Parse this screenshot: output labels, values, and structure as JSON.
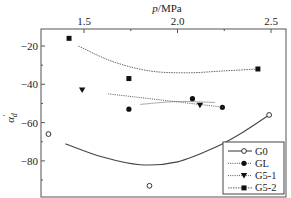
{
  "chart_data": {
    "type": "scatter",
    "title": "",
    "xlabel": "p/MPa",
    "xlabel_position": "top",
    "ylabel": "α'd",
    "xlim": [
      1.27,
      2.58
    ],
    "ylim": [
      -99,
      -11
    ],
    "x_ticks": [
      1.5,
      2.0,
      2.5
    ],
    "x_tick_labels": [
      "1.5",
      "2.0",
      "2.5"
    ],
    "x_minor_ticks": [
      1.75,
      2.25
    ],
    "y_ticks": [
      -20,
      -40,
      -60,
      -80
    ],
    "y_tick_labels": [
      "-20",
      "-40",
      "-60",
      "-80"
    ],
    "y_minor_ticks": [
      -30,
      -50,
      -70,
      -90
    ],
    "grid": false,
    "legend_position": "lower right",
    "series": [
      {
        "name": "G0",
        "marker": "open-circle",
        "line_style": "solid",
        "color": "#444444",
        "points": [
          {
            "x": 1.31,
            "y": -66
          },
          {
            "x": 1.85,
            "y": -93
          },
          {
            "x": 2.49,
            "y": -56
          }
        ],
        "fit_curve": [
          {
            "x": 1.4,
            "y": -71
          },
          {
            "x": 1.6,
            "y": -78
          },
          {
            "x": 1.8,
            "y": -82
          },
          {
            "x": 2.0,
            "y": -80.5
          },
          {
            "x": 2.2,
            "y": -73
          },
          {
            "x": 2.35,
            "y": -65
          },
          {
            "x": 2.49,
            "y": -56
          }
        ]
      },
      {
        "name": "GL",
        "marker": "filled-circle",
        "line_style": "solid-light",
        "color": "#111111",
        "points": [
          {
            "x": 1.74,
            "y": -53
          },
          {
            "x": 2.08,
            "y": -47.5
          },
          {
            "x": 2.24,
            "y": -52
          }
        ],
        "fit_curve": [
          {
            "x": 1.8,
            "y": -50.5
          },
          {
            "x": 2.0,
            "y": -49
          },
          {
            "x": 2.2,
            "y": -49.5
          }
        ]
      },
      {
        "name": "G5-1",
        "marker": "filled-triangle-down",
        "line_style": "dotted",
        "color": "#111111",
        "points": [
          {
            "x": 1.49,
            "y": -43
          },
          {
            "x": 2.12,
            "y": -51
          }
        ],
        "fit_curve": [
          {
            "x": 1.63,
            "y": -45
          },
          {
            "x": 2.25,
            "y": -52
          }
        ]
      },
      {
        "name": "G5-2",
        "marker": "filled-square",
        "line_style": "dashed-dotted",
        "color": "#111111",
        "points": [
          {
            "x": 1.42,
            "y": -16
          },
          {
            "x": 1.74,
            "y": -37
          },
          {
            "x": 2.43,
            "y": -32
          }
        ],
        "fit_curve": [
          {
            "x": 1.47,
            "y": -20
          },
          {
            "x": 1.65,
            "y": -28
          },
          {
            "x": 1.85,
            "y": -33
          },
          {
            "x": 2.05,
            "y": -34
          },
          {
            "x": 2.25,
            "y": -33
          },
          {
            "x": 2.43,
            "y": -32
          }
        ]
      }
    ]
  }
}
